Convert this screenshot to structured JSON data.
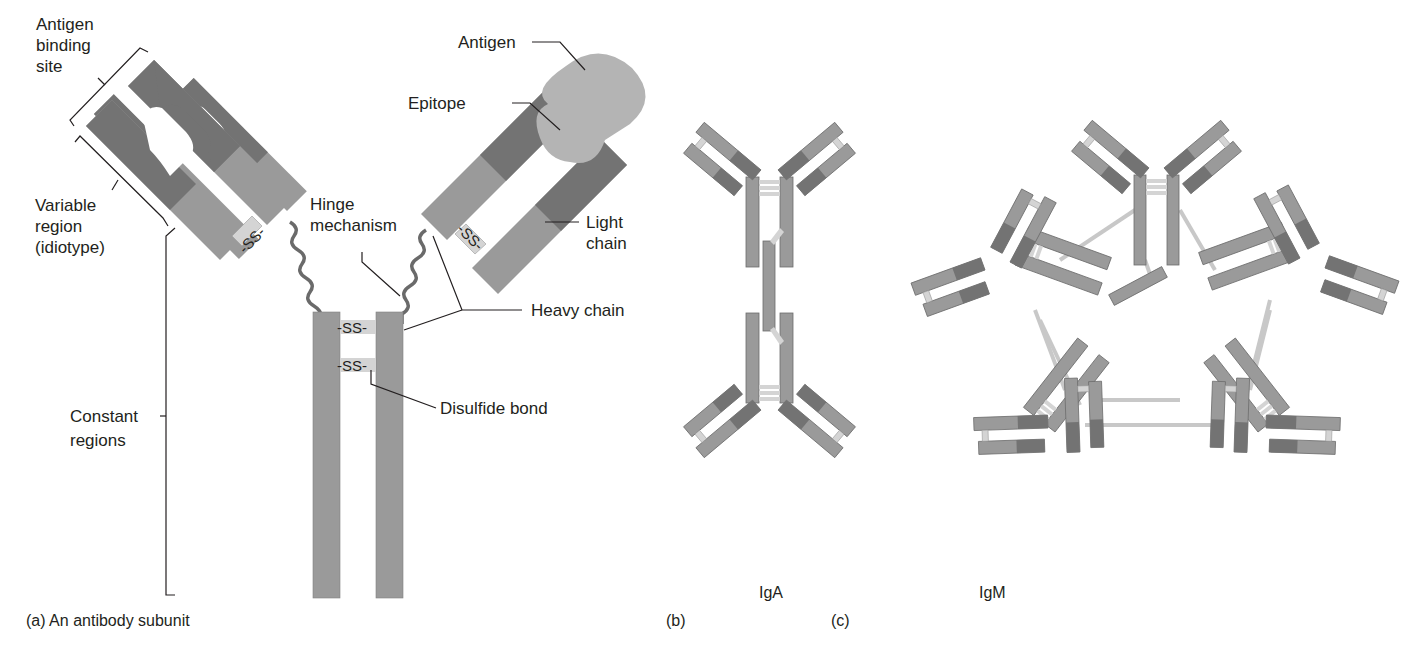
{
  "figure": {
    "colors": {
      "variable_dark": "#737373",
      "constant": "#9a9a9a",
      "antigen": "#b4b4b4",
      "disulfide_bridge": "#d4d4d4",
      "hinge": "#6a6a6a",
      "leader_line": "#231f20",
      "background": "#ffffff"
    },
    "panel_a": {
      "caption": "(a) An antibody subunit",
      "labels": {
        "antigen_binding_site": [
          "Antigen",
          "binding",
          "site"
        ],
        "variable_region": [
          "Variable",
          "region",
          "(idiotype)"
        ],
        "constant_regions": [
          "Constant",
          "regions"
        ],
        "antigen": "Antigen",
        "epitope": "Epitope",
        "hinge_mechanism": [
          "Hinge",
          "mechanism"
        ],
        "light_chain": [
          "Light",
          "chain"
        ],
        "heavy_chain": "Heavy chain",
        "disulfide_bond": "Disulfide bond"
      },
      "bond_symbol": "SS"
    },
    "panel_b": {
      "caption": "(b)",
      "title": "IgA",
      "structure": "dimer",
      "subunits": 2
    },
    "panel_c": {
      "caption": "(c)",
      "title": "IgM",
      "structure": "pentamer",
      "subunits": 5
    }
  }
}
